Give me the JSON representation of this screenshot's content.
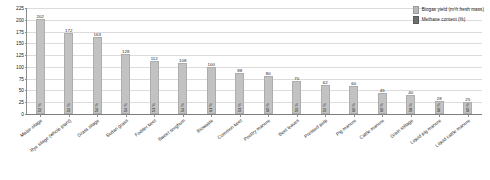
{
  "chart_data": {
    "type": "bar",
    "title": "",
    "xlabel": "",
    "ylabel": "",
    "ylim": [
      0,
      225
    ],
    "ytick_step": 25,
    "yticks": [
      0,
      25,
      50,
      75,
      100,
      125,
      150,
      175,
      200,
      225
    ],
    "grid": true,
    "legend_position": "top-right",
    "categories": [
      "Maize silage",
      "Rye silage (whole plant)",
      "Grass silage",
      "Sudan grass",
      "Fodder beet",
      "Sweet sorghum",
      "Biowaste",
      "Common beet",
      "Poultry manure",
      "Beet leaves",
      "Pressed pulp",
      "Pig manure",
      "Cattle manure",
      "Grain stillage",
      "Liquid pig manure",
      "Liquid cattle manure"
    ],
    "series": [
      {
        "name": "Biogas yield (m³/t fresh mass)",
        "color": "#c2c2c2",
        "values": [
          202,
          172,
          163,
          128,
          112,
          108,
          100,
          88,
          80,
          70,
          62,
          60,
          45,
          40,
          28,
          25
        ]
      },
      {
        "name": "Methane content (%)",
        "color": "#6f6f6f",
        "values": [
          52,
          52,
          54,
          54,
          51,
          54,
          61,
          53,
          60,
          55,
          52,
          60,
          60,
          58,
          60,
          60
        ]
      }
    ],
    "methane_labels": [
      "52 %",
      "52 %",
      "54 %",
      "54 %",
      "51 %",
      "54 %",
      "61 %",
      "53 %",
      "60 %",
      "55 %",
      "52 %",
      "60 %",
      "60 %",
      "58 %",
      "60 %",
      "60 %"
    ]
  },
  "legend": {
    "items": [
      {
        "label": "Biogas yield (m³/t fresh mass)",
        "swatch": "biogas-swatch"
      },
      {
        "label": "Methane content (%)",
        "swatch": "methane-swatch"
      }
    ]
  }
}
